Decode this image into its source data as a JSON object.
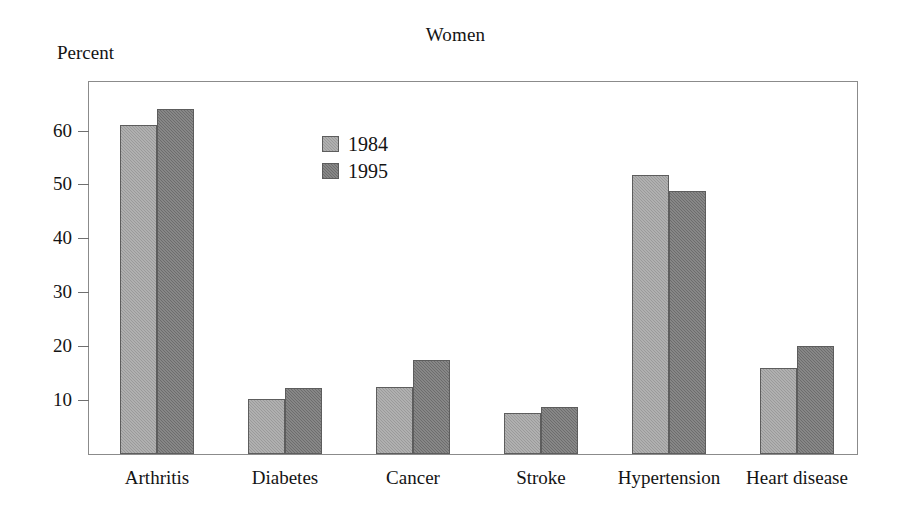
{
  "chart_data": {
    "type": "bar",
    "title": "Women",
    "xlabel": "",
    "ylabel": "Percent",
    "categories": [
      "Arthritis",
      "Diabetes",
      "Cancer",
      "Stroke",
      "Hypertension",
      "Heart disease"
    ],
    "series": [
      {
        "name": "1984",
        "color": "#9a9a9a",
        "values": [
          61.0,
          10.2,
          12.4,
          7.6,
          51.8,
          16.0
        ]
      },
      {
        "name": "1995",
        "color": "#6d6d6d",
        "values": [
          64.0,
          12.3,
          17.4,
          8.7,
          48.8,
          20.0
        ]
      }
    ],
    "ylim": [
      0,
      69
    ],
    "yticks": [
      10,
      20,
      30,
      40,
      50,
      60
    ],
    "ytick_labels": [
      "10",
      "20",
      "30",
      "40",
      "50",
      "60"
    ],
    "grid": false,
    "legend_position": "inside-upper-left",
    "frame": true
  },
  "legend": {
    "entries": [
      {
        "label": "1984"
      },
      {
        "label": "1995"
      }
    ]
  }
}
